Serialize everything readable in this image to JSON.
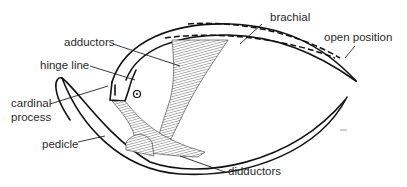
{
  "diagram": {
    "labels": {
      "brachial": "brachial",
      "open_position": "open position",
      "adductors": "adductors",
      "hinge_line": "hinge line",
      "cardinal_process_line1": "cardinal",
      "cardinal_process_line2": "process",
      "pedicle": "pedicle",
      "didductors": "didductors"
    },
    "colors": {
      "ink": "#111111",
      "background": "#ffffff"
    }
  }
}
